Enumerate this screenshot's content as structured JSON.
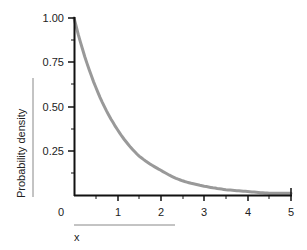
{
  "chart_data": {
    "type": "line",
    "title": "",
    "xlabel": "x",
    "ylabel": "Probability density",
    "xlim": [
      0,
      5
    ],
    "ylim": [
      0,
      1.0
    ],
    "x_ticks": [
      "0",
      "1",
      "2",
      "3",
      "4",
      "5"
    ],
    "y_ticks": [
      "0.25",
      "0.50",
      "0.75",
      "1.00"
    ],
    "grid": false,
    "legend": null,
    "series": [
      {
        "name": "exponential density f(x) = e^(-x)",
        "color": "#999999",
        "x": [
          0,
          0.5,
          1,
          1.5,
          2,
          2.5,
          3,
          3.5,
          4,
          4.5,
          5
        ],
        "values": [
          1.0,
          0.61,
          0.37,
          0.22,
          0.14,
          0.08,
          0.05,
          0.03,
          0.02,
          0.01,
          0.01
        ]
      }
    ]
  },
  "axes": {
    "x_label": "x",
    "y_label": "Probability density",
    "x_origin_label": "0",
    "x_tick_labels": [
      "1",
      "2",
      "3",
      "4",
      "5"
    ],
    "y_tick_labels": [
      "1.00",
      "0.75",
      "0.50",
      "0.25"
    ]
  },
  "colors": {
    "axis": "#111111",
    "curve": "#999999",
    "label_rule": "#888888"
  }
}
